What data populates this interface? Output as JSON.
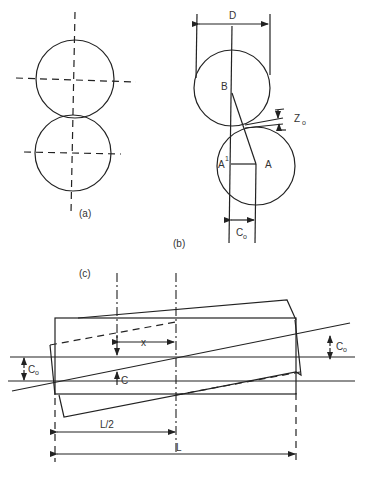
{
  "figure": {
    "panel_a": {
      "label": "(a)"
    },
    "panel_b": {
      "label": "(b)",
      "dimension_D": "D",
      "point_B": "B",
      "point_A": "A",
      "point_A_prime": "A",
      "point_A_prime_mark": "1",
      "offset_Z": "Z",
      "offset_Z_sub": "o",
      "offset_C": "C",
      "offset_C_sub": "o"
    },
    "panel_c": {
      "label": "(c)",
      "dim_x": "x",
      "dim_C": "C",
      "dim_Co_left": "C",
      "dim_Co_left_sub": "o",
      "dim_Co_right": "C",
      "dim_Co_right_sub": "o",
      "dim_half_L": "L/2",
      "dim_L": "L"
    }
  }
}
